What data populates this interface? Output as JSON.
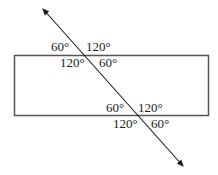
{
  "diagram": {
    "colors": {
      "stroke": "#555555",
      "line": "#1a1a1a",
      "text": "#1a1a1a",
      "background": "#ffffff"
    },
    "rectangle": {
      "x": 14.5,
      "y": 55.5,
      "width": 194,
      "height": 60
    },
    "transversal": {
      "start": {
        "x": 43,
        "y": 9
      },
      "end": {
        "x": 183,
        "y": 166
      },
      "arrows": "both"
    },
    "top_intersection": {
      "point": {
        "x": 86,
        "y": 56
      },
      "angles": {
        "upper_left": "60°",
        "upper_right": "120°",
        "lower_left": "120°",
        "lower_right": "60°"
      }
    },
    "bottom_intersection": {
      "point": {
        "x": 139,
        "y": 116
      },
      "angles": {
        "upper_left": "60°",
        "upper_right": "120°",
        "lower_left": "120°",
        "lower_right": "60°"
      }
    }
  }
}
